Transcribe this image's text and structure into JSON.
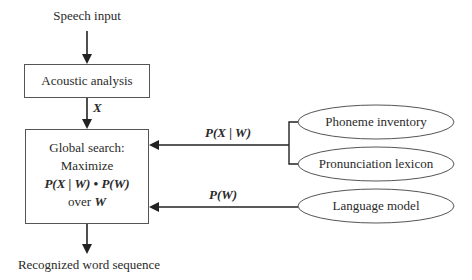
{
  "diagram": {
    "input_label": "Speech input",
    "acoustic_box": {
      "label": "Acoustic analysis"
    },
    "edge_x_label": "X",
    "global_box": {
      "line1": "Global search:",
      "line2": "Maximize",
      "line3": "P(X | W) • P(W)",
      "line4_prefix": "over",
      "line4_var": "W"
    },
    "output_label": "Recognized word sequence",
    "edge_pxw_label": "P(X | W)",
    "edge_pw_label": "P(W)",
    "knowledge_sources": [
      {
        "label": "Phoneme inventory"
      },
      {
        "label": "Pronunciation lexicon"
      },
      {
        "label": "Language model"
      }
    ],
    "colors": {
      "line": "#333333",
      "text": "#2a2a2a"
    }
  }
}
